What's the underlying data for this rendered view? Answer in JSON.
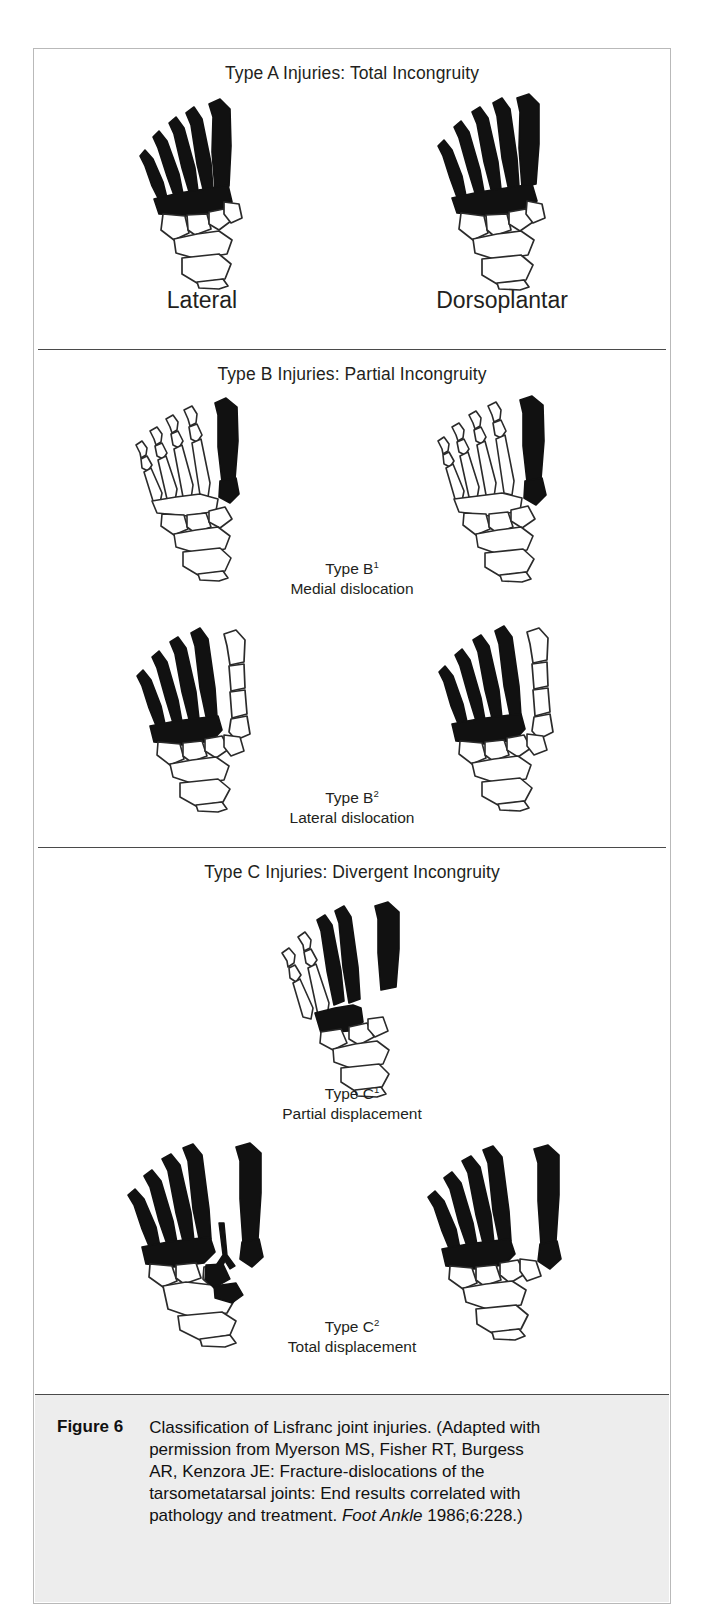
{
  "figure": {
    "number_label": "Figure 6",
    "caption_parts": [
      {
        "text": "Classification of Lisfranc joint injuries. (Adapted with permission from Myerson MS, Fisher RT, Burgess AR, Kenzora JE: Fracture-dislocations of the tarsometatarsal joints: End results correlated with pathology and treatment. ",
        "style": "normal"
      },
      {
        "text": "Foot Ankle",
        "style": "italic"
      },
      {
        "text": " 1986;6:228.)",
        "style": "normal"
      }
    ],
    "caption_full": "Classification of Lisfranc joint injuries. (Adapted with permission from Myerson MS, Fisher RT, Burgess AR, Kenzora JE: Fracture-dislocations of the tarsometatarsal joints: End results correlated with pathology and treatment. Foot Ankle 1986;6:228.)"
  },
  "sections": {
    "type_a": {
      "heading": "Type A Injuries: Total Incongruity",
      "view_left": "Lateral",
      "view_right": "Dorsoplantar"
    },
    "type_b": {
      "heading": "Type B Injuries: Partial Incongruity",
      "sub1": {
        "type_label": "Type B",
        "type_sup": "1",
        "description": "Medial dislocation"
      },
      "sub2": {
        "type_label": "Type B",
        "type_sup": "2",
        "description": "Lateral dislocation"
      }
    },
    "type_c": {
      "heading": "Type C Injuries: Divergent Incongruity",
      "sub1": {
        "type_label": "Type C",
        "type_sup": "1",
        "description": "Partial displacement"
      },
      "sub2": {
        "type_label": "Type C",
        "type_sup": "2",
        "description": "Total displacement"
      }
    }
  },
  "diagram_data": {
    "type": "medical-illustration",
    "subject": "Lisfranc (tarsometatarsal) joint fracture-dislocation classification",
    "ray_numbering": "ray 1 = medial (great toe, drawn rightmost); ray 5 = lateral (drawn leftmost)",
    "legend": {
      "black": "displaced / injured ray (solid black fill)",
      "white": "non-displaced ray and tarsal bones (outline only)"
    },
    "figures": [
      {
        "id": "A-lateral",
        "section": "type_a",
        "view": "Lateral",
        "black_rays": [
          1,
          2,
          3,
          4,
          5
        ],
        "white_rays": [],
        "divergent": false
      },
      {
        "id": "A-dorsal",
        "section": "type_a",
        "view": "Dorsoplantar",
        "black_rays": [
          1,
          2,
          3,
          4,
          5
        ],
        "white_rays": [],
        "divergent": false
      },
      {
        "id": "B1-lateral",
        "section": "type_b",
        "view": "Lateral",
        "black_rays": [
          1
        ],
        "white_rays": [
          2,
          3,
          4,
          5
        ],
        "divergent": false
      },
      {
        "id": "B1-dorsal",
        "section": "type_b",
        "view": "Dorsoplantar",
        "black_rays": [
          1
        ],
        "white_rays": [
          2,
          3,
          4,
          5
        ],
        "divergent": false
      },
      {
        "id": "B2-lateral",
        "section": "type_b",
        "view": "Lateral",
        "black_rays": [
          2,
          3,
          4,
          5
        ],
        "white_rays": [
          1
        ],
        "divergent": false
      },
      {
        "id": "B2-dorsal",
        "section": "type_b",
        "view": "Dorsoplantar",
        "black_rays": [
          2,
          3,
          4,
          5
        ],
        "white_rays": [
          1
        ],
        "divergent": false
      },
      {
        "id": "C1",
        "section": "type_c",
        "view": "Dorsoplantar",
        "black_rays": [
          1,
          2,
          3
        ],
        "white_rays": [
          4,
          5
        ],
        "divergent": true
      },
      {
        "id": "C2-left",
        "section": "type_c",
        "view": "Dorsoplantar",
        "black_rays": [
          1,
          2,
          3,
          4,
          5
        ],
        "white_rays": [],
        "divergent": true
      },
      {
        "id": "C2-right",
        "section": "type_c",
        "view": "Dorsoplantar",
        "black_rays": [
          1,
          2,
          3,
          4,
          5
        ],
        "white_rays": [],
        "divergent": true
      }
    ]
  },
  "colors": {
    "page_background": "#ffffff",
    "border": "#b9b9b9",
    "rule": "#4a4a4a",
    "bone_outline": "#2b2b2b",
    "bone_fill_black": "#111111",
    "bone_fill_white": "#ffffff",
    "caption_background": "#ededed",
    "text": "#231f20"
  }
}
